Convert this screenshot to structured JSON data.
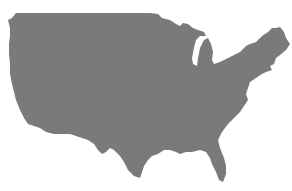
{
  "map": {
    "subject": "Contiguous United States silhouette",
    "fill_color": "#7a7a7a",
    "background_color": "#ffffff",
    "labels": []
  }
}
